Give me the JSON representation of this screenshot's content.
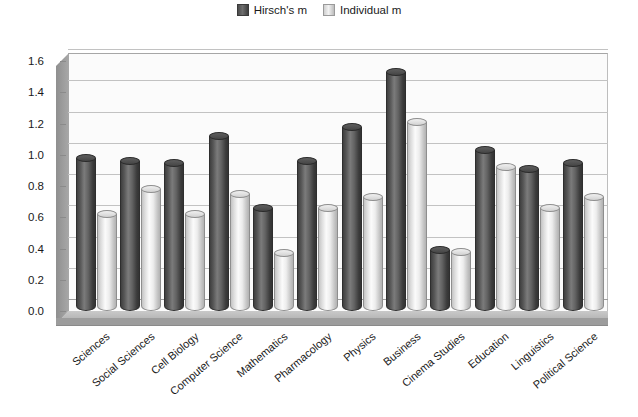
{
  "legend": {
    "position": "top-center",
    "entries": [
      {
        "label": "Hirsch's m",
        "swatch": "dark-square-icon",
        "color": "#565656"
      },
      {
        "label": "Individual m",
        "swatch": "light-square-icon",
        "color": "#e8e8e8"
      }
    ]
  },
  "axis": {
    "y_ticks": [
      "0.0",
      "0.2",
      "0.4",
      "0.6",
      "0.8",
      "1.0",
      "1.2",
      "1.4",
      "1.6"
    ]
  },
  "chart_data": {
    "type": "bar",
    "title": "",
    "xlabel": "",
    "ylabel": "",
    "ylim": [
      0.0,
      1.6
    ],
    "ytick_step": 0.2,
    "grid": true,
    "legend_position": "top-center",
    "style": "3d-cylinder",
    "categories": [
      "Sciences",
      "Social Sciences",
      "Cell Biology",
      "Computer Science",
      "Mathematics",
      "Pharmacology",
      "Physics",
      "Business",
      "Cinema Studies",
      "Education",
      "Linguistics",
      "Political Science"
    ],
    "series": [
      {
        "name": "Hirsch's m",
        "color": "#565656",
        "values": [
          0.98,
          0.96,
          0.95,
          1.12,
          0.66,
          0.96,
          1.18,
          1.53,
          0.39,
          1.03,
          0.91,
          0.95
        ]
      },
      {
        "name": "Individual m",
        "color": "#e8e8e8",
        "values": [
          0.62,
          0.78,
          0.62,
          0.75,
          0.37,
          0.66,
          0.73,
          1.21,
          0.38,
          0.92,
          0.66,
          0.73
        ]
      }
    ]
  }
}
